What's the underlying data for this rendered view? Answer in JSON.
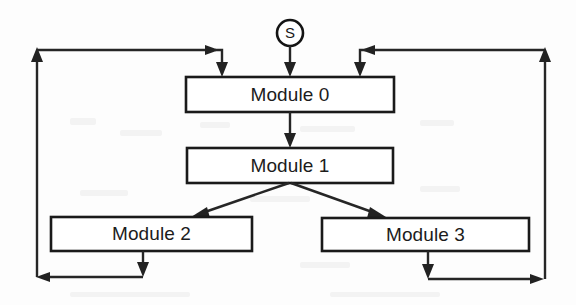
{
  "diagram": {
    "type": "flow-diagram",
    "start_node": {
      "label": "S",
      "shape": "circle",
      "cx": 290,
      "cy": 33,
      "r": 13
    },
    "modules": [
      {
        "id": "module-0",
        "label": "Module 0",
        "x": 186,
        "y": 77,
        "width": 208,
        "height": 35
      },
      {
        "id": "module-1",
        "label": "Module 1",
        "x": 187,
        "y": 148,
        "width": 206,
        "height": 35
      },
      {
        "id": "module-2",
        "label": "Module 2",
        "x": 51,
        "y": 217,
        "width": 201,
        "height": 34
      },
      {
        "id": "module-3",
        "label": "Module 3",
        "x": 322,
        "y": 218,
        "width": 207,
        "height": 33
      }
    ],
    "edges": [
      {
        "id": "edge-start-to-module0",
        "from": "S",
        "to": "Module 0",
        "kind": "straight-down"
      },
      {
        "id": "edge-module0-to-module1",
        "from": "Module 0",
        "to": "Module 1",
        "kind": "straight-down"
      },
      {
        "id": "edge-module1-to-module2",
        "from": "Module 1",
        "to": "Module 2",
        "kind": "diagonal-left"
      },
      {
        "id": "edge-module1-to-module3",
        "from": "Module 1",
        "to": "Module 3",
        "kind": "diagonal-right"
      },
      {
        "id": "edge-module2-return-to-module0",
        "from": "Module 2",
        "to": "Module 0",
        "kind": "feedback-left-loop"
      },
      {
        "id": "edge-module3-return-to-module0",
        "from": "Module 3",
        "to": "Module 0",
        "kind": "feedback-right-loop"
      }
    ],
    "colors": {
      "stroke": "#222222",
      "box_fill": "#ffffff",
      "text": "#1c1c1c",
      "background": "#fdfdfd"
    }
  }
}
